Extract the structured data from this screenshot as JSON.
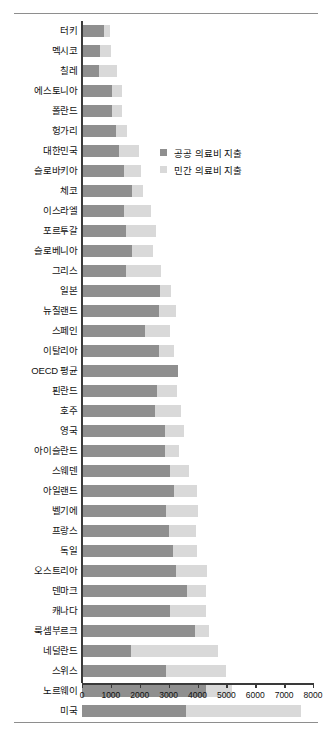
{
  "chart_data": {
    "type": "bar",
    "orientation": "horizontal",
    "stacked": true,
    "title": "",
    "subtitle": "",
    "xlabel": "",
    "ylabel": "",
    "xlim": [
      0,
      8000
    ],
    "xticks": [
      0,
      1000,
      2000,
      3000,
      4000,
      5000,
      6000,
      7000,
      8000
    ],
    "xtick_labels": [
      "0",
      "1000",
      "2000",
      "3000",
      "4000",
      "5000",
      "6000",
      "7000",
      "8000"
    ],
    "grid": false,
    "legend_position": "inside-upper-right",
    "colors": {
      "public": "#8f8f8f",
      "private": "#d9d9d9",
      "axis": "#3a3a3a",
      "text": "#111111",
      "rule": "#8e8e8e",
      "background": "#ffffff"
    },
    "legend": [
      {
        "label": "공공 의료비 지출",
        "color": "#8f8f8f"
      },
      {
        "label": "민간 의료비 지출",
        "color": "#d9d9d9"
      }
    ],
    "categories": [
      "터키",
      "멕시코",
      "칠레",
      "에스토니아",
      "폴란드",
      "헝가리",
      "대한민국",
      "슬로바키아",
      "체코",
      "이스라엘",
      "포르투갈",
      "슬로베니아",
      "그리스",
      "일본",
      "뉴질랜드",
      "스페인",
      "이탈리아",
      "OECD 평균",
      "핀란드",
      "호주",
      "영국",
      "아이슬란드",
      "스웨덴",
      "아일랜드",
      "벨기에",
      "프랑스",
      "독일",
      "오스트리아",
      "덴마크",
      "캐나다",
      "룩셈부르크",
      "네덜란드",
      "스위스",
      "노르웨이",
      "미국"
    ],
    "series": [
      {
        "name": "공공 의료비 지출",
        "color": "#8f8f8f",
        "values": [
          760,
          620,
          590,
          1050,
          1050,
          1170,
          1280,
          1470,
          1720,
          1470,
          1520,
          1720,
          1520,
          2700,
          2680,
          2170,
          2670,
          3330,
          2600,
          2530,
          2880,
          2870,
          3050,
          3170,
          2920,
          3020,
          3150,
          3240,
          3650,
          3040,
          3910,
          1700,
          2910,
          4290,
          3600
        ]
      },
      {
        "name": "민간 의료비 지출",
        "color": "#d9d9d9",
        "values": [
          210,
          380,
          620,
          320,
          320,
          380,
          700,
          560,
          380,
          930,
          1050,
          750,
          1220,
          380,
          590,
          880,
          500,
          0,
          700,
          900,
          660,
          490,
          660,
          800,
          1100,
          930,
          850,
          1100,
          650,
          1250,
          490,
          3010,
          2080,
          900,
          3980
        ]
      }
    ],
    "totals": [
      970,
      1000,
      1210,
      1370,
      1370,
      1550,
      1980,
      2030,
      2100,
      2400,
      2570,
      2470,
      2740,
      3080,
      3270,
      3050,
      3170,
      3330,
      3300,
      3430,
      3540,
      3360,
      3710,
      3970,
      4020,
      3950,
      4000,
      4340,
      4300,
      4290,
      4400,
      4710,
      4990,
      5190,
      7580
    ]
  }
}
